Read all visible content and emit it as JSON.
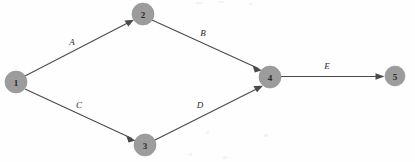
{
  "diagram": {
    "type": "directed-graph",
    "title": "",
    "background_color": "#fefefe",
    "node_fill_color": "#9c9c9c",
    "edge_color": "#4a4a4a",
    "label_color": "#2a2a2a",
    "nodes": [
      {
        "id": "1",
        "label": "1",
        "cx": 16,
        "cy": 82,
        "r": 11
      },
      {
        "id": "2",
        "label": "2",
        "cx": 143,
        "cy": 14,
        "r": 11
      },
      {
        "id": "3",
        "label": "3",
        "cx": 145,
        "cy": 145,
        "r": 11
      },
      {
        "id": "4",
        "label": "4",
        "cx": 270,
        "cy": 77,
        "r": 11
      },
      {
        "id": "5",
        "label": "5",
        "cx": 395,
        "cy": 76,
        "r": 10
      }
    ],
    "edges": [
      {
        "id": "A",
        "label": "A",
        "from": "1",
        "to": "2",
        "x1": 25,
        "y1": 76,
        "x2": 133,
        "y2": 20,
        "lx": 72,
        "ly": 42
      },
      {
        "id": "B",
        "label": "B",
        "from": "2",
        "to": "4",
        "x1": 152,
        "y1": 20,
        "x2": 261,
        "y2": 70,
        "lx": 203,
        "ly": 33
      },
      {
        "id": "C",
        "label": "C",
        "from": "1",
        "to": "3",
        "x1": 25,
        "y1": 89,
        "x2": 135,
        "y2": 140,
        "lx": 79,
        "ly": 105
      },
      {
        "id": "D",
        "label": "D",
        "from": "3",
        "to": "4",
        "x1": 155,
        "y1": 140,
        "x2": 262,
        "y2": 86,
        "lx": 200,
        "ly": 105
      },
      {
        "id": "E",
        "label": "E",
        "from": "4",
        "to": "5",
        "x1": 281,
        "y1": 76,
        "x2": 384,
        "y2": 76,
        "lx": 327,
        "ly": 66
      }
    ]
  }
}
